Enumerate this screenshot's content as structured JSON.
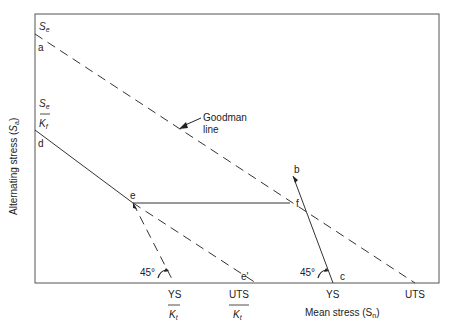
{
  "diagram": {
    "axes": {
      "ylabel_main": "Alternating stress (",
      "ylabel_sym": "S",
      "ylabel_sub": "a",
      "ylabel_close": ")",
      "xlabel": "Mean stress (S",
      "xlabel_sub": "n",
      "xlabel_close": ")"
    },
    "y_labels": {
      "se_top": "S",
      "se_top_sub": "e",
      "se_frac_num": "S",
      "se_frac_num_sub": "e",
      "se_frac_den": "K",
      "se_frac_den_sub": "f"
    },
    "x_labels": {
      "ys_kt_num": "YS",
      "ys_kt_den": "K",
      "ys_kt_den_sub": "t",
      "uts_kt_num": "UTS",
      "uts_kt_den": "K",
      "uts_kt_den_sub": "t",
      "ys": "YS",
      "uts": "UTS"
    },
    "points": {
      "a": "a",
      "b": "b",
      "c": "c",
      "d": "d",
      "e": "e",
      "e_prime": "e'",
      "f": "f"
    },
    "annotations": {
      "goodman_line_1": "Goodman",
      "goodman_line_2": "line",
      "angle_1": "45°",
      "angle_2": "45°"
    }
  }
}
